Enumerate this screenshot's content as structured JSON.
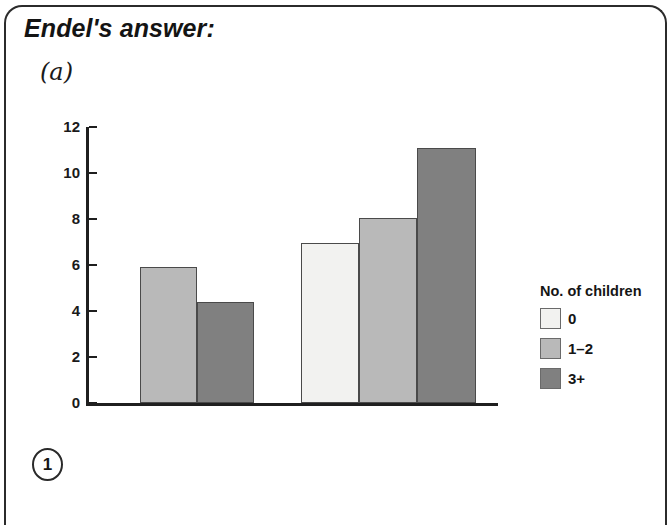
{
  "heading": "Endel's answer:",
  "part_label": "(a)",
  "page_badge": "1",
  "legend": {
    "title": "No. of children",
    "entries": [
      {
        "label": "0",
        "color": "#f2f2f0"
      },
      {
        "label": "1–2",
        "color": "#b9b9b9"
      },
      {
        "label": "3+",
        "color": "#808080"
      }
    ]
  },
  "chart_data": {
    "type": "bar",
    "title": "",
    "xlabel": "",
    "ylabel": "",
    "ylim": [
      0,
      12
    ],
    "y_ticks": [
      0,
      2,
      4,
      6,
      8,
      10,
      12
    ],
    "grid": false,
    "legend_position": "right",
    "legend_title": "No. of children",
    "categories": [
      "group-1",
      "group-2"
    ],
    "series": [
      {
        "name": "0",
        "color": "#f2f2f0",
        "values": [
          null,
          6.95
        ]
      },
      {
        "name": "1–2",
        "color": "#b9b9b9",
        "values": [
          5.9,
          8.05
        ]
      },
      {
        "name": "3+",
        "color": "#808080",
        "values": [
          4.4,
          11.1
        ]
      }
    ],
    "bars": [
      {
        "group": 1,
        "series": "1–2",
        "value": 5.9,
        "color": "#b9b9b9"
      },
      {
        "group": 1,
        "series": "3+",
        "value": 4.4,
        "color": "#808080"
      },
      {
        "group": 2,
        "series": "0",
        "value": 6.95,
        "color": "#f2f2f0"
      },
      {
        "group": 2,
        "series": "1–2",
        "value": 8.05,
        "color": "#b9b9b9"
      },
      {
        "group": 2,
        "series": "3+",
        "value": 11.1,
        "color": "#808080"
      }
    ]
  }
}
